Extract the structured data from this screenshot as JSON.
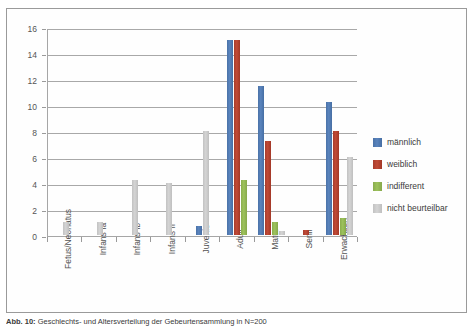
{
  "chart_data": {
    "type": "bar",
    "title": "",
    "xlabel": "",
    "ylabel": "",
    "ylim": [
      0,
      16
    ],
    "ytick_step": 2,
    "yticks": [
      "0",
      "2",
      "4",
      "6",
      "8",
      "10",
      "12",
      "14",
      "16"
    ],
    "grid": true,
    "legend_position": "right",
    "categories": [
      "Fetus/Neonatus",
      "Infans Ia",
      "Infans Ib",
      "Infans II",
      "Juvenis",
      "Adult",
      "Matur",
      "Senil",
      "Erwachsen"
    ],
    "series": [
      {
        "name": "männlich",
        "color": "#4a72a8",
        "values": [
          0,
          0,
          0,
          0,
          0.7,
          15,
          11.5,
          0,
          10.2
        ]
      },
      {
        "name": "weiblich",
        "color": "#a83c2c",
        "values": [
          0,
          0,
          0,
          0,
          0,
          15,
          7.2,
          0.4,
          8
        ]
      },
      {
        "name": "indifferent",
        "color": "#8aad4e",
        "values": [
          0,
          0,
          0,
          0,
          0,
          4.2,
          1,
          0,
          1.3
        ]
      },
      {
        "name": "nicht beurteilbar",
        "color": "#c2c2c2",
        "values": [
          1,
          1,
          4.2,
          4,
          8,
          0,
          0.3,
          0,
          6
        ]
      }
    ]
  },
  "caption": {
    "figure_number": "Abb. 10:",
    "text": "Geschlechts- und Altersverteilung der Gebeurtensammlung in N=200"
  }
}
